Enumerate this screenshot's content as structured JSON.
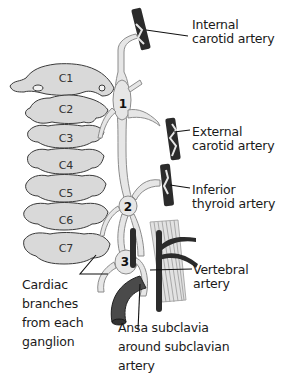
{
  "figure": {
    "colors": {
      "vertebra_fill": "#d9d9d9",
      "vertebra_stroke": "#3a3a3a",
      "chain_fill": "#e6e6e6",
      "chain_stroke": "#8c8c8c",
      "artery_dark": "#2b2b2b",
      "subclavian": "#4a4a4a",
      "muscle_fill": "#cfcfcf",
      "leader_line": "#111111",
      "text": "#1a1a1a"
    }
  },
  "vertebrae": [
    {
      "id": "C1",
      "label": "C1"
    },
    {
      "id": "C2",
      "label": "C2"
    },
    {
      "id": "C3",
      "label": "C3"
    },
    {
      "id": "C4",
      "label": "C4"
    },
    {
      "id": "C5",
      "label": "C5"
    },
    {
      "id": "C6",
      "label": "C6"
    },
    {
      "id": "C7",
      "label": "C7"
    }
  ],
  "ganglia": [
    {
      "number": "1",
      "name": "Superior cervical ganglion"
    },
    {
      "number": "2",
      "name": "Middle cervical ganglion"
    },
    {
      "number": "3",
      "name": "Inferior cervical ganglion"
    }
  ],
  "labels": {
    "internal_carotid": {
      "line1": "Internal",
      "line2": "carotid artery"
    },
    "external_carotid": {
      "line1": "External",
      "line2": "carotid artery"
    },
    "inferior_thyroid": {
      "line1": "Inferior",
      "line2": "thyroid artery"
    },
    "vertebral": {
      "line1": "Vertebral",
      "line2": "artery"
    },
    "cardiac_branches": {
      "line1": "Cardiac",
      "line2": "branches",
      "line3": "from each",
      "line4": "ganglion"
    },
    "ansa_subclavia": {
      "line1": "Ansa subclavia",
      "line2": "around subclavian",
      "line3": "artery"
    }
  }
}
